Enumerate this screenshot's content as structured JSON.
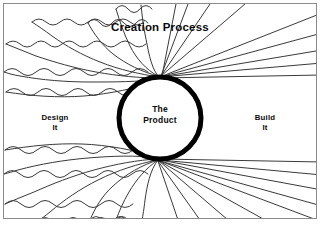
{
  "diagram": {
    "title": "Creation Process",
    "center_label": "The\nProduct",
    "left_label": "Design\nIt",
    "right_label": "Build\nIt",
    "colors": {
      "background": "#ffffff",
      "ink": "#0a0a0a",
      "line": "#3a3a3a",
      "frame": "#8a8a8a"
    },
    "geometry": {
      "width": 322,
      "height": 224,
      "circle_cx": 160,
      "circle_cy": 118,
      "circle_r": 41,
      "circle_stroke": 5,
      "top_node_x": 160,
      "top_node_y": 77,
      "bottom_node_x": 160,
      "bottom_node_y": 159
    },
    "left_side": {
      "style": "wavy",
      "description": "squiggly wavy lines converging on the product circle",
      "top_wave_count": 7,
      "bottom_wave_count": 7
    },
    "right_side": {
      "style": "straight",
      "description": "straight radiating rays emanating from the product circle",
      "top_ray_count": 9,
      "bottom_ray_count": 9
    }
  }
}
